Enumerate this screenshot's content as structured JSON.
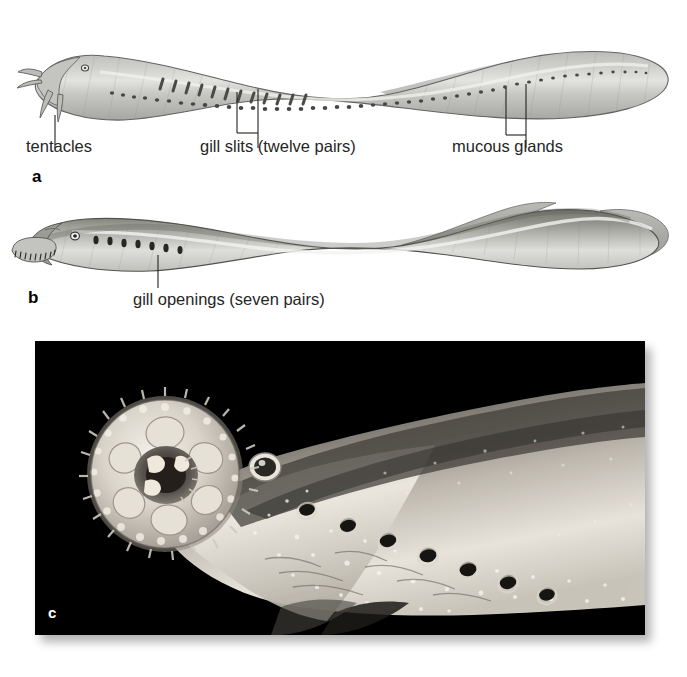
{
  "figure": {
    "background_color": "#ffffff",
    "panel_labels": [
      {
        "id": "a",
        "text": "a"
      },
      {
        "id": "b",
        "text": "b"
      },
      {
        "id": "c",
        "text": "c"
      }
    ]
  },
  "panel_a": {
    "label": "a",
    "subject": "hagfish-lateral-view",
    "callouts": [
      {
        "name": "tentacles",
        "text": "tentacles"
      },
      {
        "name": "gill-slits",
        "text": "gill slits (twelve pairs)"
      },
      {
        "name": "mucous-glands",
        "text": "mucous glands"
      }
    ],
    "counts": {
      "gill_slit_pairs": 12,
      "gill_slits_drawn": 12,
      "mucous_gland_pores_drawn": 46,
      "tentacles_drawn": 4
    },
    "colors": {
      "body_fill": "#b9bab6",
      "body_fill_light": "#d6d7d3",
      "outline": "#5d5e5b",
      "marking": "#4a4b48"
    }
  },
  "panel_b": {
    "label": "b",
    "subject": "lamprey-lateral-view",
    "callouts": [
      {
        "name": "gill-openings",
        "text": "gill openings (seven pairs)"
      }
    ],
    "counts": {
      "gill_opening_pairs": 7,
      "gill_openings_drawn": 7,
      "oral_teeth_drawn": 9
    },
    "colors": {
      "body_fill": "#8e8f8c",
      "body_fill_light": "#cfd0cd",
      "outline": "#4f504d",
      "marking": "#2b2c2a"
    }
  },
  "panel_c": {
    "label": "c",
    "subject": "lamprey-head-photograph",
    "caption_visible": false,
    "counts": {
      "gill_pores_visible": 7
    },
    "colors": {
      "background": "#000000",
      "body_highlight": "#e8e6e1",
      "body_midtone": "#9a968f",
      "body_shadow": "#3a3834",
      "label_color": "#ffffff"
    }
  }
}
